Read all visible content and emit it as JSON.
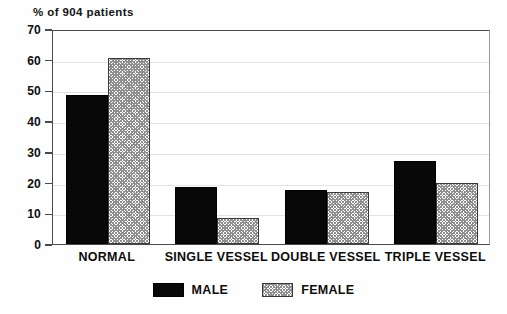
{
  "chart_data": {
    "type": "bar",
    "title": "% of 904 patients",
    "xlabel": "",
    "ylabel": "",
    "ylim": [
      0,
      70
    ],
    "yticks": [
      0,
      10,
      20,
      30,
      40,
      50,
      60,
      70
    ],
    "grid": true,
    "legend_position": "bottom-center",
    "categories": [
      "NORMAL",
      "SINGLE VESSEL",
      "DOUBLE VESSEL",
      "TRIPLE VESSEL"
    ],
    "series": [
      {
        "name": "MALE",
        "color": "#080808",
        "fill": "solid",
        "values": [
          48.5,
          18.5,
          17.5,
          27.0
        ]
      },
      {
        "name": "FEMALE",
        "color": "#8f8f8f",
        "fill": "crosshatch",
        "values": [
          60.5,
          8.5,
          16.8,
          20.0
        ]
      }
    ]
  },
  "legend": {
    "entries": [
      {
        "label": "MALE",
        "swatch": "solid-black-swatch"
      },
      {
        "label": "FEMALE",
        "swatch": "hatched-gray-swatch"
      }
    ]
  }
}
